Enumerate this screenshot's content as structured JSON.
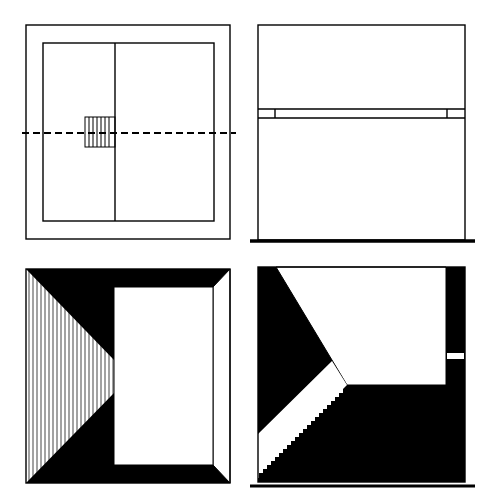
{
  "figure": {
    "panels": [
      {
        "id": "plan",
        "label": "Floor plan with central stair and section cut line"
      },
      {
        "id": "elevation",
        "label": "Elevation with horizontal band"
      },
      {
        "id": "interior-view",
        "label": "Interior perspective with hatched wall"
      },
      {
        "id": "section",
        "label": "Section with stair"
      }
    ],
    "colors": {
      "ink": "#000000",
      "paper": "#ffffff",
      "hatch": "#555555"
    }
  }
}
